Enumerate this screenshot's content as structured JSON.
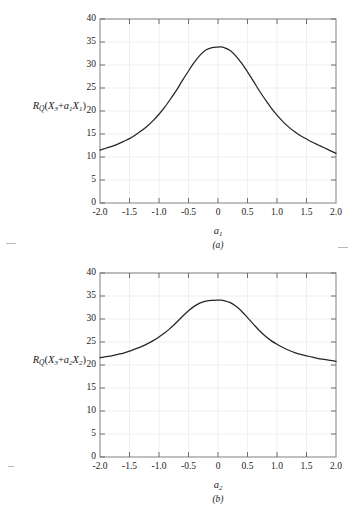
{
  "figure": {
    "title": "",
    "panels": [
      {
        "id": "a",
        "caption": "(a)",
        "ylabel_prefix": "R",
        "ylabel_qsub": "Q",
        "ylabel_open": "(X",
        "ylabel_sub3": "3",
        "ylabel_plus": "+",
        "ylabel_a": "a",
        "ylabel_asub": "1",
        "ylabel_X": "X",
        "ylabel_Xsub": "1",
        "ylabel_close": ")",
        "xlabel_main": "a",
        "xlabel_sub": "1",
        "yticks": [
          "0",
          "5",
          "10",
          "15",
          "20",
          "25",
          "30",
          "35",
          "40"
        ],
        "xticks": [
          "-2.0",
          "-1.5",
          "-1.0",
          "-0.5",
          "0",
          "0.5",
          "1.0",
          "1.5",
          "2.0"
        ]
      },
      {
        "id": "b",
        "caption": "(b)",
        "ylabel_prefix": "R",
        "ylabel_qsub": "Q",
        "ylabel_open": "(X",
        "ylabel_sub3": "3",
        "ylabel_plus": "+",
        "ylabel_a": "a",
        "ylabel_asub": "2",
        "ylabel_X": "X",
        "ylabel_Xsub": "2",
        "ylabel_close": ")",
        "xlabel_main": "a",
        "xlabel_sub": "2",
        "yticks": [
          "0",
          "5",
          "10",
          "15",
          "20",
          "25",
          "30",
          "35",
          "40"
        ],
        "xticks": [
          "-2.0",
          "-1.5",
          "-1.0",
          "-0.5",
          "0",
          "0.5",
          "1.0",
          "1.5",
          "2.0"
        ]
      }
    ]
  },
  "chart_data": [
    {
      "type": "line",
      "panel": "a",
      "title": "",
      "xlabel": "a_1",
      "ylabel": "R_Q(X_3 + a_1 X_1)",
      "xlim": [
        -2.0,
        2.0
      ],
      "ylim": [
        0,
        40
      ],
      "xticks": [
        -2.0,
        -1.5,
        -1.0,
        -0.5,
        0,
        0.5,
        1.0,
        1.5,
        2.0
      ],
      "yticks": [
        0,
        5,
        10,
        15,
        20,
        25,
        30,
        35,
        40
      ],
      "grid": true,
      "legend": "none",
      "series": [
        {
          "name": "R_Q(X3+a1X1)",
          "color": "#262626",
          "x": [
            -2.0,
            -1.9,
            -1.8,
            -1.7,
            -1.6,
            -1.5,
            -1.4,
            -1.3,
            -1.2,
            -1.1,
            -1.0,
            -0.9,
            -0.8,
            -0.7,
            -0.6,
            -0.5,
            -0.4,
            -0.3,
            -0.2,
            -0.1,
            0.0,
            0.05,
            0.1,
            0.2,
            0.3,
            0.4,
            0.5,
            0.6,
            0.7,
            0.8,
            0.9,
            1.0,
            1.1,
            1.2,
            1.3,
            1.4,
            1.5,
            1.6,
            1.7,
            1.8,
            1.9,
            2.0
          ],
          "y": [
            11.5,
            11.9,
            12.3,
            12.8,
            13.4,
            14.0,
            14.8,
            15.7,
            16.7,
            17.9,
            19.3,
            20.9,
            22.7,
            24.6,
            26.7,
            28.7,
            30.6,
            32.2,
            33.3,
            33.8,
            33.9,
            33.95,
            33.8,
            33.2,
            32.0,
            30.4,
            28.5,
            26.5,
            24.4,
            22.5,
            20.7,
            19.1,
            17.7,
            16.5,
            15.5,
            14.6,
            13.9,
            13.2,
            12.6,
            12.0,
            11.4,
            10.8
          ]
        }
      ]
    },
    {
      "type": "line",
      "panel": "b",
      "title": "",
      "xlabel": "a_2",
      "ylabel": "R_Q(X_3 + a_2 X_2)",
      "xlim": [
        -2.0,
        2.0
      ],
      "ylim": [
        0,
        40
      ],
      "xticks": [
        -2.0,
        -1.5,
        -1.0,
        -0.5,
        0,
        0.5,
        1.0,
        1.5,
        2.0
      ],
      "yticks": [
        0,
        5,
        10,
        15,
        20,
        25,
        30,
        35,
        40
      ],
      "grid": true,
      "legend": "none",
      "series": [
        {
          "name": "R_Q(X3+a2X2)",
          "color": "#262626",
          "x": [
            -2.0,
            -1.9,
            -1.8,
            -1.7,
            -1.6,
            -1.5,
            -1.4,
            -1.3,
            -1.2,
            -1.1,
            -1.0,
            -0.9,
            -0.8,
            -0.7,
            -0.6,
            -0.5,
            -0.4,
            -0.3,
            -0.2,
            -0.1,
            0.0,
            0.05,
            0.1,
            0.2,
            0.3,
            0.4,
            0.5,
            0.6,
            0.7,
            0.8,
            0.9,
            1.0,
            1.1,
            1.2,
            1.3,
            1.4,
            1.5,
            1.6,
            1.7,
            1.8,
            1.9,
            2.0
          ],
          "y": [
            21.6,
            21.8,
            22.0,
            22.3,
            22.6,
            23.0,
            23.5,
            24.0,
            24.6,
            25.3,
            26.1,
            27.0,
            28.1,
            29.3,
            30.6,
            31.8,
            32.8,
            33.5,
            33.9,
            34.05,
            34.1,
            34.1,
            34.0,
            33.6,
            32.8,
            31.7,
            30.3,
            28.9,
            27.5,
            26.3,
            25.3,
            24.5,
            23.8,
            23.2,
            22.7,
            22.3,
            22.0,
            21.7,
            21.4,
            21.2,
            21.0,
            20.8
          ]
        }
      ]
    }
  ]
}
